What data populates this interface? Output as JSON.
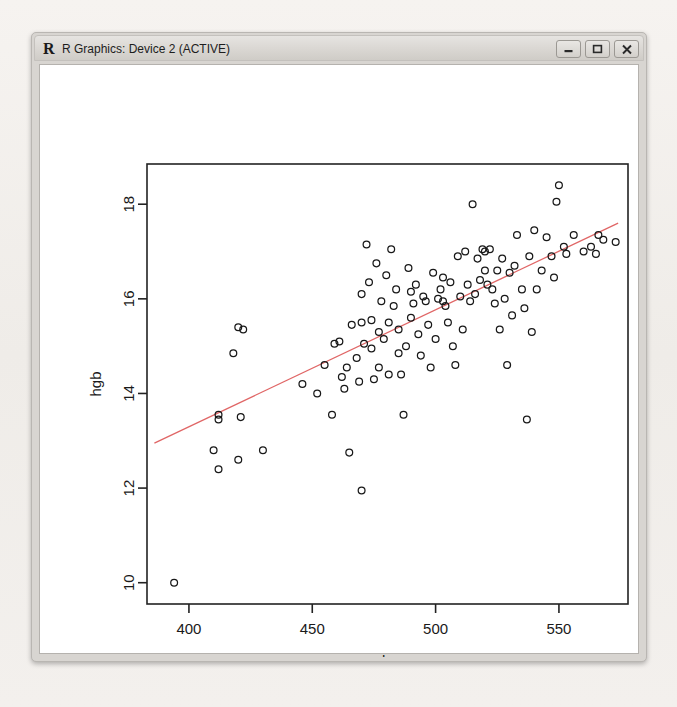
{
  "window": {
    "title": "R Graphics: Device 2 (ACTIVE)",
    "logo": "R",
    "buttons": {
      "minimize": "minimize-button",
      "maximize": "maximize-button",
      "close": "close-button"
    }
  },
  "chart_data": {
    "type": "scatter",
    "title": "",
    "xlabel": "rbc",
    "ylabel": "hgb",
    "xlim": [
      383,
      578
    ],
    "ylim": [
      9.55,
      18.85
    ],
    "xticks": [
      400,
      450,
      500,
      550
    ],
    "yticks": [
      10,
      12,
      14,
      16,
      18
    ],
    "grid": false,
    "legend": null,
    "point_symbol": "open-circle",
    "fit_line": {
      "type": "linear-regression",
      "color": "#e06666",
      "x_start": 386,
      "y_start": 12.95,
      "x_end": 574,
      "y_end": 17.6
    },
    "points": [
      [
        394,
        10.0
      ],
      [
        410,
        12.8
      ],
      [
        412,
        12.4
      ],
      [
        412,
        13.55
      ],
      [
        412,
        13.45
      ],
      [
        420,
        15.4
      ],
      [
        422,
        15.35
      ],
      [
        418,
        14.85
      ],
      [
        421,
        13.5
      ],
      [
        420,
        12.6
      ],
      [
        430,
        12.8
      ],
      [
        446,
        14.2
      ],
      [
        452,
        14.0
      ],
      [
        455,
        14.6
      ],
      [
        458,
        13.55
      ],
      [
        459,
        15.05
      ],
      [
        461,
        15.1
      ],
      [
        462,
        14.35
      ],
      [
        463,
        14.1
      ],
      [
        464,
        14.55
      ],
      [
        466,
        15.45
      ],
      [
        468,
        14.75
      ],
      [
        469,
        14.25
      ],
      [
        470,
        15.5
      ],
      [
        470,
        16.1
      ],
      [
        471,
        15.05
      ],
      [
        472,
        17.15
      ],
      [
        473,
        16.35
      ],
      [
        474,
        14.95
      ],
      [
        474,
        15.55
      ],
      [
        475,
        14.3
      ],
      [
        476,
        16.75
      ],
      [
        477,
        15.3
      ],
      [
        477,
        14.55
      ],
      [
        478,
        15.95
      ],
      [
        479,
        15.15
      ],
      [
        480,
        16.5
      ],
      [
        481,
        15.5
      ],
      [
        481,
        14.4
      ],
      [
        482,
        17.05
      ],
      [
        483,
        15.85
      ],
      [
        484,
        16.2
      ],
      [
        485,
        15.35
      ],
      [
        485,
        14.85
      ],
      [
        486,
        14.4
      ],
      [
        487,
        13.55
      ],
      [
        488,
        15.0
      ],
      [
        489,
        16.65
      ],
      [
        490,
        16.15
      ],
      [
        490,
        15.6
      ],
      [
        491,
        15.9
      ],
      [
        492,
        16.3
      ],
      [
        493,
        15.25
      ],
      [
        494,
        14.8
      ],
      [
        495,
        16.05
      ],
      [
        496,
        15.95
      ],
      [
        497,
        15.45
      ],
      [
        498,
        14.55
      ],
      [
        499,
        16.55
      ],
      [
        500,
        15.15
      ],
      [
        501,
        16.0
      ],
      [
        502,
        16.2
      ],
      [
        503,
        16.45
      ],
      [
        503,
        15.95
      ],
      [
        504,
        15.85
      ],
      [
        505,
        15.5
      ],
      [
        506,
        16.35
      ],
      [
        507,
        15.0
      ],
      [
        508,
        14.6
      ],
      [
        509,
        16.9
      ],
      [
        510,
        16.05
      ],
      [
        511,
        15.35
      ],
      [
        512,
        17.0
      ],
      [
        513,
        16.3
      ],
      [
        514,
        15.95
      ],
      [
        515,
        18.0
      ],
      [
        516,
        16.1
      ],
      [
        517,
        16.85
      ],
      [
        518,
        16.4
      ],
      [
        519,
        17.05
      ],
      [
        520,
        17.0
      ],
      [
        520,
        16.6
      ],
      [
        521,
        16.3
      ],
      [
        522,
        17.05
      ],
      [
        523,
        16.2
      ],
      [
        524,
        15.9
      ],
      [
        525,
        16.6
      ],
      [
        526,
        15.35
      ],
      [
        527,
        16.85
      ],
      [
        528,
        16.0
      ],
      [
        529,
        14.6
      ],
      [
        530,
        16.55
      ],
      [
        531,
        15.65
      ],
      [
        532,
        16.7
      ],
      [
        533,
        17.35
      ],
      [
        535,
        16.2
      ],
      [
        536,
        15.8
      ],
      [
        537,
        13.45
      ],
      [
        538,
        16.9
      ],
      [
        539,
        15.3
      ],
      [
        540,
        17.45
      ],
      [
        541,
        16.2
      ],
      [
        543,
        16.6
      ],
      [
        545,
        17.3
      ],
      [
        547,
        16.9
      ],
      [
        548,
        16.45
      ],
      [
        549,
        18.05
      ],
      [
        550,
        18.4
      ],
      [
        552,
        17.1
      ],
      [
        553,
        16.95
      ],
      [
        556,
        17.35
      ],
      [
        560,
        17.0
      ],
      [
        563,
        17.1
      ],
      [
        565,
        16.95
      ],
      [
        566,
        17.35
      ],
      [
        568,
        17.25
      ],
      [
        573,
        17.2
      ],
      [
        465,
        12.75
      ],
      [
        470,
        11.95
      ]
    ]
  }
}
